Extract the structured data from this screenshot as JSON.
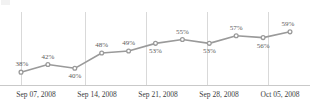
{
  "chart_data": {
    "type": "line",
    "title": "",
    "subtitle": "",
    "xlabel": "",
    "ylabel": "",
    "grid": "vertical-only",
    "legend": "none",
    "ylim": [
      36,
      61
    ],
    "line_color": "#9a9a9a",
    "marker_color": "#9a9a9a",
    "gridline_color": "#d9d9d9",
    "label_color": "#5b5b5b",
    "tick_label_color": "#3d3d3d",
    "values": [
      38,
      42,
      40,
      48,
      49,
      53,
      55,
      53,
      57,
      56,
      59
    ],
    "point_labels": [
      "38%",
      "42%",
      "40%",
      "48%",
      "49%",
      "53%",
      "55%",
      "53%",
      "57%",
      "56%",
      "59%"
    ],
    "tick_labels": [
      "Sep 07, 2008",
      "Sep 14, 2008",
      "Sep 21, 2008",
      "Sep 28, 2008",
      "Oct 05, 2008"
    ]
  }
}
